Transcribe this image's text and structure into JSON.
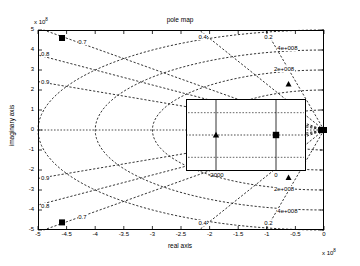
{
  "chart_data": {
    "type": "scatter",
    "title": "pole map",
    "xlabel": "real axis",
    "ylabel": "imaginary axis",
    "x_exponent_label": "x 10",
    "x_exponent_power": "8",
    "y_exponent_label": "x 10",
    "y_exponent_power": "8",
    "xlim": [
      -5,
      0
    ],
    "ylim": [
      -5,
      5
    ],
    "grid": false,
    "xticks": [
      "-5",
      "-4.5",
      "-4",
      "-3.5",
      "-3",
      "-2.5",
      "-2",
      "-1.5",
      "-1",
      "-0.5",
      "0"
    ],
    "xtick_values": [
      -5,
      -4.5,
      -4,
      -3.5,
      -3,
      -2.5,
      -2,
      -1.5,
      -1,
      -0.5,
      0
    ],
    "yticks": [
      "5",
      "4",
      "3",
      "2",
      "1",
      "0",
      "-1",
      "-2",
      "-3",
      "-4",
      "-5"
    ],
    "ytick_values": [
      5,
      4,
      3,
      2,
      1,
      0,
      -1,
      -2,
      -3,
      -4,
      -5
    ],
    "damping_labels": [
      {
        "text": "0.7",
        "x": -4.2,
        "y": 4.35
      },
      {
        "text": "0.8",
        "x": -4.85,
        "y": 3.75
      },
      {
        "text": "0.9",
        "x": -4.85,
        "y": 2.35
      },
      {
        "text": "0.4",
        "x": -2.1,
        "y": 4.62
      },
      {
        "text": "0.2",
        "x": -0.95,
        "y": 4.62
      },
      {
        "text": "0.9",
        "x": -4.85,
        "y": -2.45
      },
      {
        "text": "0.8",
        "x": -4.85,
        "y": -3.85
      },
      {
        "text": "0.7",
        "x": -4.2,
        "y": -4.42
      },
      {
        "text": "0.4",
        "x": -2.1,
        "y": -4.72
      },
      {
        "text": "0.2",
        "x": -0.95,
        "y": -4.72
      }
    ],
    "frequency_labels": [
      {
        "text": "4e+008",
        "x": -0.72,
        "y": 4.05
      },
      {
        "text": "2e+008",
        "x": -0.78,
        "y": 3.0
      },
      {
        "text": "2e+008",
        "x": -0.78,
        "y": -3.02
      },
      {
        "text": "4e+008",
        "x": -0.72,
        "y": -4.08
      }
    ],
    "series": [
      {
        "name": "poles",
        "marker": "triangle",
        "points": [
          {
            "x": -0.62,
            "y": 2.3
          },
          {
            "x": -0.62,
            "y": -2.38
          },
          {
            "x": -0.02,
            "y": 0.0
          }
        ]
      },
      {
        "name": "zeros",
        "marker": "square",
        "points": [
          {
            "x": -4.58,
            "y": 4.6
          },
          {
            "x": -4.58,
            "y": -4.62
          },
          {
            "x": -0.01,
            "y": 0.0
          }
        ]
      }
    ],
    "inset": {
      "xticks": [
        "-2000",
        "0"
      ],
      "xtick_values": [
        -2000,
        0
      ],
      "markers": [
        {
          "type": "triangle",
          "x": -2000,
          "y": 0
        },
        {
          "type": "square",
          "x": 0,
          "y": 0
        }
      ]
    }
  }
}
